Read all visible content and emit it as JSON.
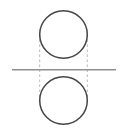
{
  "diagram": {
    "canvas": {
      "width": 126,
      "height": 132,
      "background": "#ffffff"
    },
    "colors": {
      "circle_stroke": "#464646",
      "axis_line": "#8f8f8f",
      "dashed_line": "#b8b8b8"
    },
    "circles": [
      {
        "name": "top-circle",
        "cx": 63.5,
        "cy": 34.5,
        "r": 23.8,
        "stroke_width": 1.5
      },
      {
        "name": "bottom-circle",
        "cx": 63.5,
        "cy": 100.5,
        "r": 23.8,
        "stroke_width": 1.5
      }
    ],
    "axis_line": {
      "x1": 12,
      "y1": 69.8,
      "x2": 116,
      "y2": 69.8,
      "stroke_width": 1.5
    },
    "dashed_lines": [
      {
        "name": "left-tangent-dashed-line",
        "x1": 39.7,
        "y1": 34.5,
        "x2": 39.7,
        "y2": 100.5,
        "stroke_width": 1,
        "dash": "2.5,2.5"
      },
      {
        "name": "right-tangent-dashed-line",
        "x1": 87.3,
        "y1": 34.5,
        "x2": 87.3,
        "y2": 100.5,
        "stroke_width": 1,
        "dash": "2.5,2.5"
      }
    ]
  }
}
